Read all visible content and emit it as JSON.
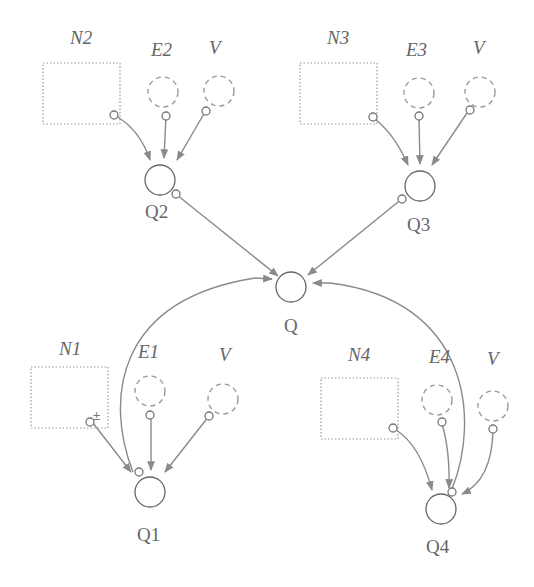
{
  "diagram": {
    "title": "",
    "nodes": {
      "N1": {
        "label": "N1",
        "type": "stock"
      },
      "N2": {
        "label": "N2",
        "type": "stock"
      },
      "N3": {
        "label": "N3",
        "type": "stock"
      },
      "N4": {
        "label": "N4",
        "type": "stock"
      },
      "E1": {
        "label": "E1",
        "type": "ghost"
      },
      "E2": {
        "label": "E2",
        "type": "ghost"
      },
      "E3": {
        "label": "E3",
        "type": "ghost"
      },
      "E4": {
        "label": "E4",
        "type": "ghost"
      },
      "V1": {
        "label": "V",
        "type": "ghost"
      },
      "V2": {
        "label": "V",
        "type": "ghost"
      },
      "V3": {
        "label": "V",
        "type": "ghost"
      },
      "V4": {
        "label": "V",
        "type": "ghost"
      },
      "Q": {
        "label": "Q",
        "type": "auxiliary"
      },
      "Q1": {
        "label": "Q1",
        "type": "auxiliary"
      },
      "Q2": {
        "label": "Q2",
        "type": "auxiliary"
      },
      "Q3": {
        "label": "Q3",
        "type": "auxiliary"
      },
      "Q4": {
        "label": "Q4",
        "type": "auxiliary"
      }
    },
    "edges": [
      {
        "from": "N2",
        "to": "Q2"
      },
      {
        "from": "E2",
        "to": "Q2"
      },
      {
        "from": "V2",
        "to": "Q2"
      },
      {
        "from": "N3",
        "to": "Q3"
      },
      {
        "from": "E3",
        "to": "Q3"
      },
      {
        "from": "V3",
        "to": "Q3"
      },
      {
        "from": "Q2",
        "to": "Q"
      },
      {
        "from": "Q3",
        "to": "Q"
      },
      {
        "from": "Q1",
        "to": "Q"
      },
      {
        "from": "Q4",
        "to": "Q"
      },
      {
        "from": "N1",
        "to": "Q1"
      },
      {
        "from": "E1",
        "to": "Q1"
      },
      {
        "from": "V1",
        "to": "Q1"
      },
      {
        "from": "N4",
        "to": "Q4"
      },
      {
        "from": "E4",
        "to": "Q4"
      },
      {
        "from": "V4",
        "to": "Q4"
      }
    ],
    "colors": {
      "stroke": "#8a8a8a",
      "text": "#666666",
      "background": "#ffffff"
    }
  }
}
